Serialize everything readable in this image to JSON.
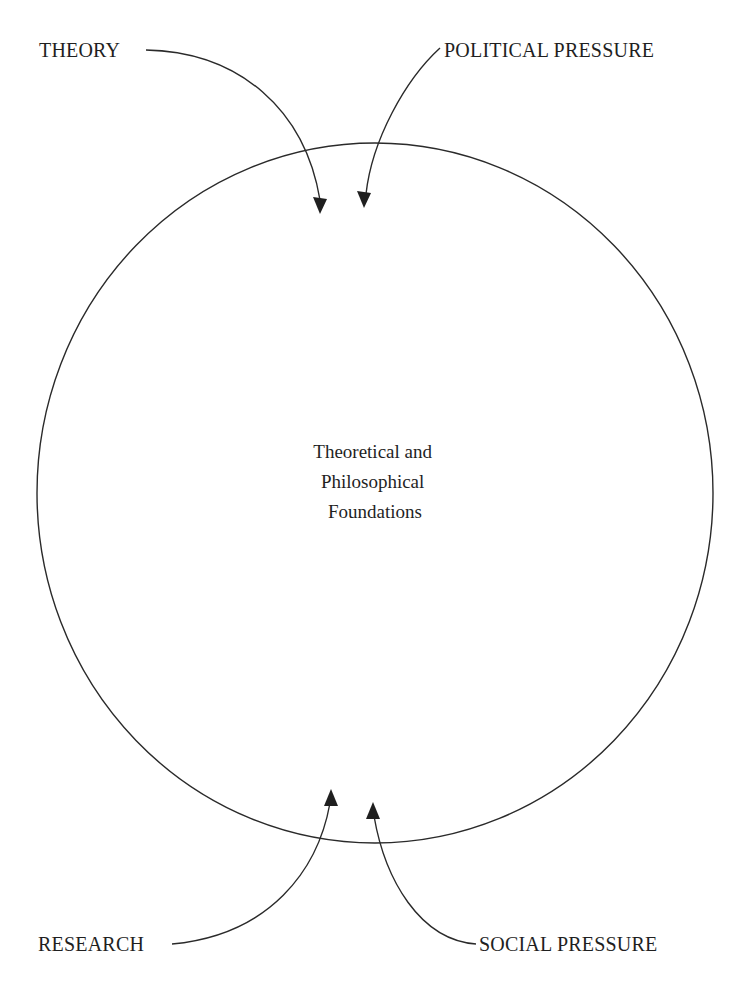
{
  "diagram": {
    "type": "influence-diagram",
    "center_node": {
      "lines": [
        "Theoretical and",
        "Philosophical",
        "Foundations"
      ],
      "shape": "circle",
      "cx": 375,
      "cy": 493,
      "rx": 338,
      "ry": 350
    },
    "inputs": [
      {
        "id": "theory",
        "label": "THEORY",
        "label_x": 39,
        "label_y": 57,
        "anchor": "start",
        "path": "M146,50 C240,52 305,110 320,200",
        "arrow_tip": [
          320,
          214
        ],
        "direction": "down"
      },
      {
        "id": "political-pressure",
        "label": "POLITICAL PRESSURE",
        "label_x": 444,
        "label_y": 57,
        "anchor": "start",
        "path": "M440,48 C405,80 372,140 366,194",
        "arrow_tip": [
          364,
          208
        ],
        "direction": "down"
      },
      {
        "id": "research",
        "label": "RESEARCH",
        "label_x": 38,
        "label_y": 951,
        "anchor": "start",
        "path": "M172,944 C270,935 318,870 330,803",
        "arrow_tip": [
          331,
          789
        ],
        "direction": "up"
      },
      {
        "id": "social-pressure",
        "label": "SOCIAL PRESSURE",
        "label_x": 479,
        "label_y": 951,
        "anchor": "start",
        "path": "M476,944 C420,940 385,880 374,816",
        "arrow_tip": [
          373,
          802
        ],
        "direction": "up"
      }
    ],
    "colors": {
      "ink": "#1f1f1f",
      "line": "#2a2a2a",
      "background": "#ffffff"
    }
  },
  "caption": {
    "text": ""
  }
}
